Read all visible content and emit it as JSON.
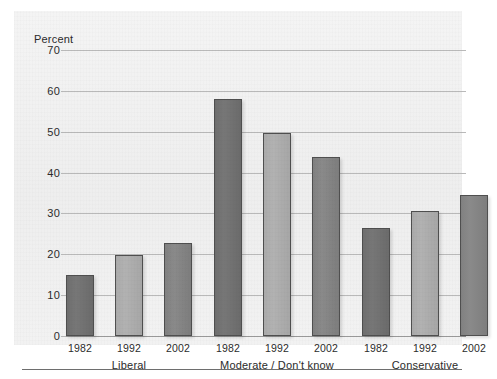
{
  "chart_data": {
    "type": "bar",
    "title": "",
    "subtitle": "",
    "xlabel": "",
    "ylabel": "Percent",
    "ylim": [
      0,
      70
    ],
    "yticks": [
      0,
      10,
      20,
      30,
      40,
      50,
      60,
      70
    ],
    "ytick_labels": [
      "0",
      "10",
      "20",
      "30",
      "40",
      "50",
      "60",
      "70"
    ],
    "grid": true,
    "legend": "none",
    "categories": [
      "Liberal",
      "Moderate / Don't know",
      "Conservative"
    ],
    "x": [
      "1982",
      "1992",
      "2002"
    ],
    "series": [
      {
        "name": "1982",
        "values": [
          15.0,
          58.0,
          26.5
        ],
        "color": "#6f6f6f"
      },
      {
        "name": "1992",
        "values": [
          19.8,
          49.6,
          30.6
        ],
        "color": "#aaaaaa"
      },
      {
        "name": "2002",
        "values": [
          22.8,
          43.7,
          34.6
        ],
        "color": "#818181"
      }
    ],
    "bars": [
      {
        "group": "Liberal",
        "year": "1982",
        "value": 15.0
      },
      {
        "group": "Liberal",
        "year": "1992",
        "value": 19.8
      },
      {
        "group": "Liberal",
        "year": "2002",
        "value": 22.8
      },
      {
        "group": "Moderate / Don't know",
        "year": "1982",
        "value": 58.0
      },
      {
        "group": "Moderate / Don't know",
        "year": "1992",
        "value": 49.6
      },
      {
        "group": "Moderate / Don't know",
        "year": "2002",
        "value": 43.7
      },
      {
        "group": "Conservative",
        "year": "1982",
        "value": 26.5
      },
      {
        "group": "Conservative",
        "year": "1992",
        "value": 30.6
      },
      {
        "group": "Conservative",
        "year": "2002",
        "value": 34.6
      }
    ]
  },
  "axis": {
    "percent_label": "Percent",
    "tick_70": "70",
    "tick_60": "60",
    "tick_50": "50",
    "tick_40": "40",
    "tick_30": "30",
    "tick_20": "20",
    "tick_10": "10",
    "tick_0": "0"
  },
  "xlabels": [
    "1982",
    "1992",
    "2002",
    "1982",
    "1992",
    "2002",
    "1982",
    "1992",
    "2002"
  ],
  "grouplabels": [
    "Liberal",
    "Moderate / Don't know",
    "Conservative"
  ],
  "colors": {
    "panel_background": "#f1f1f1",
    "page_background": "#ffffff",
    "gridline": "#b9b9b9",
    "baseline": "#9a9a9a",
    "bar_1982": "#6f6f6f",
    "bar_1992": "#aaaaaa",
    "bar_2002": "#818181",
    "bar_outline": "#4f4f4f",
    "text": "#2b2b2b",
    "rule": "#6e6e6e"
  }
}
